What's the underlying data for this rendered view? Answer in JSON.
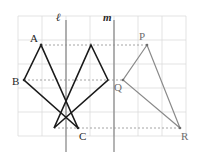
{
  "figure": {
    "kind": "geometry-reflection-diagram",
    "canvas": {
      "width": 204,
      "height": 160
    },
    "grid": {
      "visible": true,
      "color": "#dcdcdc",
      "cell_size": 24,
      "origin_x": 18,
      "origin_y": 16,
      "cols": 7,
      "rows": 6,
      "x_lines": [
        18,
        42,
        66,
        90,
        114,
        138,
        162,
        186
      ],
      "y_lines": [
        16,
        40,
        64,
        88,
        112,
        136
      ]
    },
    "mirror_lines": [
      {
        "name": "l",
        "label": "ℓ",
        "x": 66,
        "y1": 20,
        "y2": 152,
        "color": "#8c8c8c",
        "label_x": 56,
        "label_y": 12
      },
      {
        "name": "m",
        "label": "m",
        "x": 114,
        "y1": 20,
        "y2": 152,
        "color": "#8c8c8c",
        "label_x": 103,
        "label_y": 12
      }
    ],
    "points": [
      {
        "id": "A",
        "label": "A",
        "x": 41,
        "y": 45,
        "label_x": 30,
        "label_y": 33,
        "color": "#262626"
      },
      {
        "id": "B",
        "label": "B",
        "x": 24,
        "y": 80,
        "label_x": 12,
        "label_y": 76,
        "color": "#262626"
      },
      {
        "id": "C",
        "label": "C",
        "x": 78,
        "y": 128,
        "label_x": 79,
        "label_y": 131,
        "color": "#262626"
      },
      {
        "id": "P",
        "label": "P",
        "x": 147,
        "y": 45,
        "label_x": 139,
        "label_y": 31,
        "color": "#6e6e6e"
      },
      {
        "id": "Q",
        "label": "Q",
        "x": 123,
        "y": 80,
        "label_x": 114,
        "label_y": 82,
        "color": "#6e6e6e"
      },
      {
        "id": "R",
        "label": "R",
        "x": 180,
        "y": 128,
        "label_x": 181,
        "label_y": 131,
        "color": "#6e6e6e"
      }
    ],
    "triangles": [
      {
        "name": "ABC",
        "description": "original triangle",
        "vertices": [
          [
            41,
            45
          ],
          [
            24,
            80
          ],
          [
            78,
            128
          ]
        ],
        "stroke": "#1a1a1a",
        "stroke_width": 1.6
      },
      {
        "name": "A'B'C'",
        "description": "reflection of ABC across line l",
        "vertices": [
          [
            91,
            45
          ],
          [
            108,
            80
          ],
          [
            54,
            128
          ]
        ],
        "stroke": "#1a1a1a",
        "stroke_width": 1.6
      },
      {
        "name": "PQR",
        "description": "reflection of A'B'C' across line m",
        "vertices": [
          [
            147,
            45
          ],
          [
            123,
            80
          ],
          [
            180,
            128
          ]
        ],
        "stroke": "#8a8a8a",
        "stroke_width": 1.2
      }
    ],
    "correspondence_lines": [
      {
        "from": [
          41,
          45
        ],
        "to": [
          147,
          45
        ],
        "color": "#9a9a9a",
        "dash": "2,2"
      },
      {
        "from": [
          24,
          80
        ],
        "to": [
          123,
          80
        ],
        "color": "#9a9a9a",
        "dash": "2,2"
      },
      {
        "from": [
          54,
          128
        ],
        "to": [
          180,
          128
        ],
        "color": "#9a9a9a",
        "dash": "2,2"
      }
    ]
  }
}
